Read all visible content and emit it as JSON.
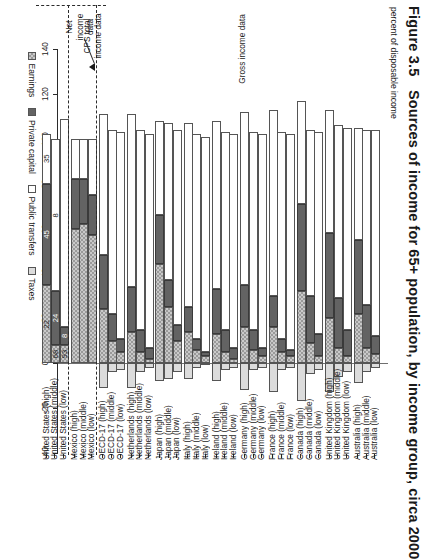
{
  "figure": {
    "number": "Figure 3.5",
    "title": "Sources of income for 65+ population, by income group, circa 2000",
    "axis_title": "percent of disposable income"
  },
  "annotations": {
    "cps": "CPS total\nincome data",
    "cps_line1": "CPS total",
    "cps_line2": "income data",
    "net": "Net\nincome\ndata",
    "net_line1": "Net",
    "net_line2": "income",
    "net_line3": "data",
    "gross": "Gross income data"
  },
  "legend": {
    "position": "bottom-left",
    "items": [
      {
        "label": "Earnings",
        "swatch": "earnings-swatch",
        "color": "#c9c9c9"
      },
      {
        "label": "Private capital",
        "swatch": "private-capital-swatch",
        "color": "#636363"
      },
      {
        "label": "Public transfers",
        "swatch": "public-transfers-swatch",
        "color": "#ffffff"
      },
      {
        "label": "Taxes",
        "swatch": "taxes-swatch",
        "color": "#dcdcdc"
      }
    ]
  },
  "chart_data": {
    "type": "bar",
    "orientation": "horizontal-stacked",
    "title": "Sources of income for 65+ population, by income group, circa 2000",
    "xlabel": "percent of disposable income",
    "ylabel": "",
    "xlim": [
      -40,
      140
    ],
    "ticks": [
      "140",
      "120",
      "100",
      "80",
      "60",
      "40",
      "20",
      "0",
      "-20",
      "-40"
    ],
    "tick_values": [
      140,
      120,
      100,
      80,
      60,
      40,
      20,
      0,
      -20,
      -40
    ],
    "grid": false,
    "legend": [
      "Earnings",
      "Private capital",
      "Public transfers",
      "Taxes"
    ],
    "categories": [
      "Australia (low)",
      "Australia (middle)",
      "Australia (high)",
      "United Kingdom (low)",
      "United Kingdom (middle)",
      "United Kingdom (high)",
      "Canada (low)",
      "Canada (middle)",
      "Canada (high)",
      "France (low)",
      "France (middle)",
      "France (high)",
      "Germany (low)",
      "Germany (middle)",
      "Germany (high)",
      "Ireland (low)",
      "Ireland (middle)",
      "Ireland (high)",
      "Italy (low)",
      "Italy (middle)",
      "Italy (high)",
      "Japan (low)",
      "Japan (middle)",
      "Japan (high)",
      "Netherlands (low)",
      "Netherlands (middle)",
      "Netherlands (high)",
      "OECD-17 (low)",
      "OECD-17 (middle)",
      "OECD-17 (high)",
      "Mexico (low)",
      "Mexico (middle)",
      "Mexico (high)",
      "United States (low)",
      "United States (middle)",
      "United States (high)"
    ],
    "series": [
      {
        "name": "Earnings",
        "values": [
          4,
          7,
          22,
          3,
          7,
          20,
          3,
          9,
          32,
          3,
          5,
          16,
          3,
          6,
          16,
          2,
          5,
          13,
          3,
          6,
          14,
          10,
          25,
          44,
          2,
          5,
          14,
          5,
          10,
          24,
          57,
          62,
          60,
          8,
          8,
          35
        ]
      },
      {
        "name": "Private capital",
        "values": [
          8,
          19,
          33,
          12,
          22,
          38,
          10,
          21,
          39,
          3,
          6,
          14,
          4,
          9,
          19,
          5,
          10,
          20,
          2,
          5,
          11,
          7,
          12,
          22,
          5,
          10,
          20,
          6,
          12,
          24,
          18,
          20,
          22,
          8,
          24,
          45
        ]
      },
      {
        "name": "Public transfers",
        "values": [
          92,
          78,
          50,
          90,
          77,
          55,
          90,
          74,
          46,
          96,
          92,
          83,
          95,
          88,
          77,
          95,
          88,
          75,
          96,
          91,
          82,
          87,
          70,
          42,
          95,
          89,
          77,
          92,
          82,
          63,
          25,
          18,
          18,
          93,
          68,
          22
        ]
      },
      {
        "name": "Taxes",
        "values": [
          -2,
          -4,
          -9,
          -4,
          -6,
          -13,
          -3,
          -5,
          -17,
          -2,
          -3,
          -13,
          -2,
          -3,
          -12,
          -2,
          -3,
          -8,
          -1,
          -2,
          -7,
          -4,
          -7,
          -8,
          -2,
          -4,
          -11,
          -3,
          -4,
          -11,
          0,
          0,
          0,
          0,
          0,
          0
        ]
      }
    ],
    "value_labels": {
      "United States (high)": {
        "earnings": "22",
        "private_capital": "45",
        "public_transfers": "35"
      },
      "United States (middle)": {
        "earnings": "68",
        "private_capital": "24",
        "public_transfers": "8"
      },
      "United States (low)": {
        "earnings": "93",
        "private_capital": "8"
      }
    },
    "group_bands": [
      {
        "name": "Gross income data",
        "from": "Australia (low)",
        "to": "OECD-17 (high)"
      },
      {
        "name": "Net income data",
        "from": "Mexico (low)",
        "to": "Mexico (high)"
      },
      {
        "name": "CPS total income data",
        "from": "United States (low)",
        "to": "United States (high)"
      }
    ]
  }
}
